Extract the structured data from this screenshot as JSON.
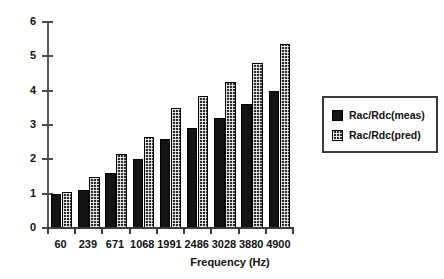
{
  "chart_data": {
    "type": "bar",
    "title": "",
    "xlabel": "Frequency (Hz)",
    "ylabel": "",
    "categories": [
      "60",
      "239",
      "671",
      "1068",
      "1991",
      "2486",
      "3028",
      "3880",
      "4900"
    ],
    "series": [
      {
        "name": "Rac/Rdc(meas)",
        "values": [
          1.0,
          1.12,
          1.6,
          2.0,
          2.6,
          2.9,
          3.2,
          3.6,
          4.0
        ]
      },
      {
        "name": "Rac/Rdc(pred)",
        "values": [
          1.05,
          1.48,
          2.15,
          2.65,
          3.5,
          3.85,
          4.25,
          4.8,
          5.35
        ]
      }
    ],
    "ylim": [
      0,
      6
    ],
    "yticks": [
      0,
      1,
      2,
      3,
      4,
      5,
      6
    ],
    "ytick_labels": [
      "0",
      "1",
      "2",
      "3",
      "4",
      "5",
      "6"
    ],
    "grid": false,
    "legend_position": "right",
    "colors": {
      "measured": "#141414",
      "predicted": "#2a2a2a",
      "axis": "#3c3c3c",
      "background": "#ffffff"
    }
  },
  "legend": {
    "items": [
      {
        "label": "Rac/Rdc(meas)",
        "pattern": "solid"
      },
      {
        "label": "Rac/Rdc(pred)",
        "pattern": "dotted"
      }
    ]
  }
}
